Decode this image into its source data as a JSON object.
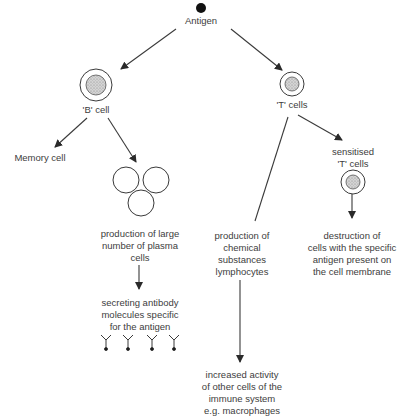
{
  "diagram": {
    "type": "flowchart",
    "nodes": {
      "antigen": "Antigen",
      "b_cell": "'B' cell",
      "t_cells": "'T' cells",
      "memory_cell": "Memory cell",
      "plasma_production": [
        "production of large",
        "number of plasma",
        "cells"
      ],
      "antibody_secretion": [
        "secreting antibody",
        "molecules specific",
        "for the antigen"
      ],
      "chemical_production": [
        "production of",
        "chemical",
        "substances",
        "lymphocytes"
      ],
      "sensitised_t": [
        "sensitised",
        "'T' cells"
      ],
      "destruction": [
        "destruction of",
        "cells with the specific",
        "antigen present on",
        "the cell membrane"
      ],
      "increased_activity": [
        "increased activity",
        "of other cells of the",
        "immune system",
        "e.g. macrophages"
      ]
    },
    "edges": [
      [
        "antigen",
        "b_cell"
      ],
      [
        "antigen",
        "t_cells"
      ],
      [
        "b_cell",
        "memory_cell"
      ],
      [
        "b_cell",
        "plasma_cells"
      ],
      [
        "plasma_cells",
        "plasma_production"
      ],
      [
        "plasma_production",
        "antibody_secretion"
      ],
      [
        "t_cells",
        "chemical_production"
      ],
      [
        "t_cells",
        "sensitised_t"
      ],
      [
        "sensitised_t",
        "destruction"
      ],
      [
        "chemical_production",
        "increased_activity"
      ]
    ],
    "colors": {
      "line": "#3a3a3a",
      "cell_fill": "#bdbdbd"
    }
  }
}
